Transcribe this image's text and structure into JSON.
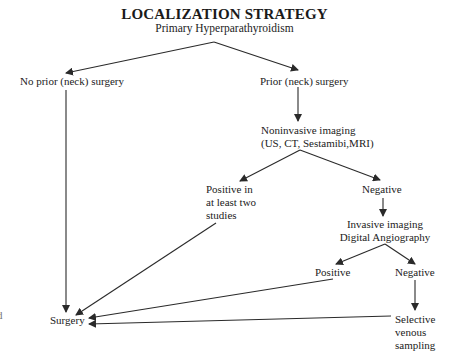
{
  "diagram": {
    "title": "LOCALIZATION STRATEGY",
    "subtitle": "Primary Hyperparathyroidism",
    "nodes": {
      "no_prior": "No prior (neck) surgery",
      "prior": "Prior (neck) surgery",
      "noninvasive_1": "Noninvasive imaging",
      "noninvasive_2": "(US, CT, Sestamibi,MRI)",
      "positive_two_1": "Positive in",
      "positive_two_2": "at least two",
      "positive_two_3": "studies",
      "negative_1": "Negative",
      "invasive_1": "Invasive imaging",
      "invasive_2": "Digital Angiography",
      "positive_2": "Positive",
      "negative_2": "Negative",
      "selective_1": "Selective",
      "selective_2": "venous",
      "selective_3": "sampling",
      "surgery": "Surgery",
      "edge_fragment": "d"
    },
    "edges": [
      {
        "from": "Primary Hyperparathyroidism",
        "to": "No prior (neck) surgery"
      },
      {
        "from": "Primary Hyperparathyroidism",
        "to": "Prior (neck) surgery"
      },
      {
        "from": "Prior (neck) surgery",
        "to": "Noninvasive imaging"
      },
      {
        "from": "Noninvasive imaging",
        "to": "Positive in at least two studies"
      },
      {
        "from": "Noninvasive imaging",
        "to": "Negative"
      },
      {
        "from": "Negative",
        "to": "Invasive imaging Digital Angiography"
      },
      {
        "from": "Invasive imaging Digital Angiography",
        "to": "Positive"
      },
      {
        "from": "Invasive imaging Digital Angiography",
        "to": "Negative (2)"
      },
      {
        "from": "Negative (2)",
        "to": "Selective venous sampling"
      },
      {
        "from": "No prior (neck) surgery",
        "to": "Surgery"
      },
      {
        "from": "Positive in at least two studies",
        "to": "Surgery"
      },
      {
        "from": "Positive",
        "to": "Surgery"
      },
      {
        "from": "Selective venous sampling",
        "to": "Surgery"
      }
    ],
    "colors": {
      "line": "#2a2a2a",
      "text": "#222222"
    }
  }
}
